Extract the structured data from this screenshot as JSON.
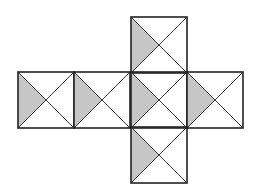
{
  "diagram": {
    "type": "cube-net",
    "square_size": 56,
    "colors": {
      "background": "#ffffff",
      "line": "#222222",
      "shade": "#c6c6c6"
    },
    "faces": [
      {
        "id": "top",
        "x": 131,
        "y": 17,
        "shaded_triangle": "left"
      },
      {
        "id": "left-1",
        "x": 18,
        "y": 72,
        "shaded_triangle": "left"
      },
      {
        "id": "left-2",
        "x": 74,
        "y": 72,
        "shaded_triangle": "left"
      },
      {
        "id": "center",
        "x": 131,
        "y": 72,
        "shaded_triangle": "left"
      },
      {
        "id": "right",
        "x": 187,
        "y": 72,
        "shaded_triangle": "left"
      },
      {
        "id": "bottom",
        "x": 131,
        "y": 127,
        "shaded_triangle": "left"
      }
    ]
  }
}
